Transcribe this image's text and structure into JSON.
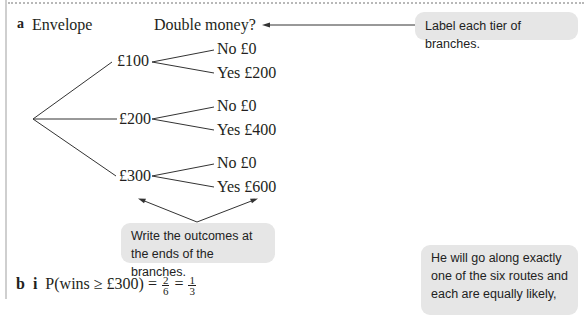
{
  "part_a": {
    "label": "a",
    "header_envelope": "Envelope",
    "header_double": "Double money?",
    "envelopes": [
      {
        "label": "£100",
        "outcomes": [
          {
            "label": "No £0"
          },
          {
            "label": "Yes £200"
          }
        ]
      },
      {
        "label": "£200",
        "outcomes": [
          {
            "label": "No £0"
          },
          {
            "label": "Yes £400"
          }
        ]
      },
      {
        "label": "£300",
        "outcomes": [
          {
            "label": "No £0"
          },
          {
            "label": "Yes £600"
          }
        ]
      }
    ]
  },
  "callouts": {
    "tiers": "Label each tier of branches.",
    "outcomes_line1": "Write the outcomes at",
    "outcomes_line2": "the ends of the branches.",
    "routes_line1": "He will go along exactly",
    "routes_line2": "one of the six routes and",
    "routes_line3": "each are equally likely,"
  },
  "part_b": {
    "label_b": "b",
    "label_i": "i",
    "expression": "P(wins ≥ £300) =",
    "frac1_num": "2",
    "frac1_den": "6",
    "equals": "=",
    "frac2_num": "1",
    "frac2_den": "3"
  }
}
